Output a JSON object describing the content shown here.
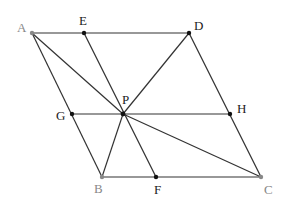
{
  "diagram": {
    "type": "geometry",
    "points": {
      "A": {
        "label": "A",
        "x": 32,
        "y": 33
      },
      "E": {
        "label": "E",
        "x": 84,
        "y": 33
      },
      "D": {
        "label": "D",
        "x": 189,
        "y": 33
      },
      "G": {
        "label": "G",
        "x": 72,
        "y": 114
      },
      "P": {
        "label": "P",
        "x": 123,
        "y": 114
      },
      "H": {
        "label": "H",
        "x": 230,
        "y": 114
      },
      "B": {
        "label": "B",
        "x": 102,
        "y": 177
      },
      "F": {
        "label": "F",
        "x": 156,
        "y": 177
      },
      "C": {
        "label": "C",
        "x": 261,
        "y": 177
      }
    },
    "segments": [
      "AD",
      "AB",
      "BC",
      "CD",
      "EF",
      "GH",
      "PA",
      "PB",
      "PC",
      "PD"
    ]
  }
}
